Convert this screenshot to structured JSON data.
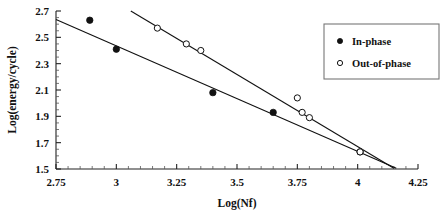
{
  "chart_data": {
    "type": "scatter",
    "title": "",
    "xlabel": "Log(Nf)",
    "ylabel": "Log(energy/cycle)",
    "xlim": [
      2.75,
      4.25
    ],
    "ylim": [
      1.5,
      2.7
    ],
    "xticks": [
      "2.75",
      "3",
      "3.25",
      "3.5",
      "3.75",
      "4",
      "4.25"
    ],
    "xtick_values": [
      2.75,
      3,
      3.25,
      3.5,
      3.75,
      4,
      4.25
    ],
    "yticks": [
      "1.5",
      "1.7",
      "1.9",
      "2.1",
      "2.3",
      "2.5",
      "2.7"
    ],
    "ytick_values": [
      1.5,
      1.7,
      1.9,
      2.1,
      2.3,
      2.5,
      2.7
    ],
    "minor_tick_step_x": 0.05,
    "grid": false,
    "legend_position": "top-right",
    "series": [
      {
        "name": "In-phase",
        "marker": "filled-circle",
        "color": "#111111",
        "points": [
          {
            "x": 2.89,
            "y": 2.63
          },
          {
            "x": 3.0,
            "y": 2.41
          },
          {
            "x": 3.4,
            "y": 2.08
          },
          {
            "x": 3.65,
            "y": 1.93
          },
          {
            "x": 4.01,
            "y": 1.63
          }
        ],
        "fit_line": {
          "x1": 2.75,
          "y1": 2.635,
          "x2": 4.16,
          "y2": 1.505
        }
      },
      {
        "name": "Out-of-phase",
        "marker": "open-circle",
        "color": "#111111",
        "points": [
          {
            "x": 3.17,
            "y": 2.57
          },
          {
            "x": 3.29,
            "y": 2.45
          },
          {
            "x": 3.35,
            "y": 2.4
          },
          {
            "x": 3.75,
            "y": 2.04
          },
          {
            "x": 3.77,
            "y": 1.93
          },
          {
            "x": 3.8,
            "y": 1.89
          },
          {
            "x": 4.01,
            "y": 1.63
          }
        ],
        "fit_line": {
          "x1": 3.06,
          "y1": 2.7,
          "x2": 4.15,
          "y2": 1.505
        }
      }
    ]
  },
  "legend": {
    "entries": [
      {
        "label": "In-phase",
        "marker": "filled-circle"
      },
      {
        "label": "Out-of-phase",
        "marker": "open-circle"
      }
    ]
  }
}
